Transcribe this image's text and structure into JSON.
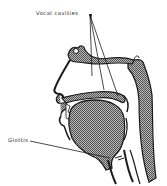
{
  "diagram": {
    "labels": {
      "vocal_cavities": "Vocal cavities",
      "glottis": "Glottis"
    },
    "colors": {
      "ink": "#1a1a1a",
      "tissue_fill": "#8c8c8c",
      "background": "#ffffff"
    }
  }
}
